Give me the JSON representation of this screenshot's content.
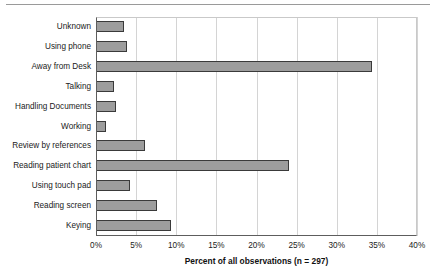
{
  "chart_data": {
    "type": "bar",
    "orientation": "horizontal",
    "title": "",
    "xlabel": "Percent of all observations (n = 297)",
    "ylabel": "",
    "xlim": [
      0,
      40
    ],
    "xtick_labels": [
      "0%",
      "5%",
      "10%",
      "15%",
      "20%",
      "25%",
      "30%",
      "35%",
      "40%"
    ],
    "xticks": [
      0,
      5,
      10,
      15,
      20,
      25,
      30,
      35,
      40
    ],
    "grid": true,
    "legend": null,
    "sample_size": 297,
    "units": "percent",
    "categories": [
      "Unknown",
      "Using phone",
      "Away from Desk",
      "Talking",
      "Handling Documents",
      "Working",
      "Review by references",
      "Reading patient chart",
      "Using touch pad",
      "Reading screen",
      "Keying"
    ],
    "values": [
      3.5,
      3.9,
      34.4,
      2.3,
      2.5,
      1.2,
      6.1,
      24.1,
      4.2,
      7.6,
      9.4
    ],
    "bar_fill_color": "#9d9d9d",
    "bar_edge_color": "#3a3a3a",
    "grid_color": "#d4d4d4",
    "axis_color": "#5d5d5d"
  }
}
